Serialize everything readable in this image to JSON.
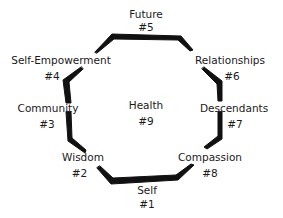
{
  "diagram": {
    "type": "octagon-cycle",
    "stroke_color": "#111111",
    "text_color": "#1a1a1a",
    "center": {
      "label": "Health",
      "number": "#9"
    },
    "nodes": [
      {
        "label": "Self",
        "number": "#1"
      },
      {
        "label": "Wisdom",
        "number": "#2"
      },
      {
        "label": "Community",
        "number": "#3"
      },
      {
        "label": "Self-Empowerment",
        "number": "#4"
      },
      {
        "label": "Future",
        "number": "#5"
      },
      {
        "label": "Relationships",
        "number": "#6"
      },
      {
        "label": "Descendants",
        "number": "#7"
      },
      {
        "label": "Compassion",
        "number": "#8"
      }
    ]
  }
}
